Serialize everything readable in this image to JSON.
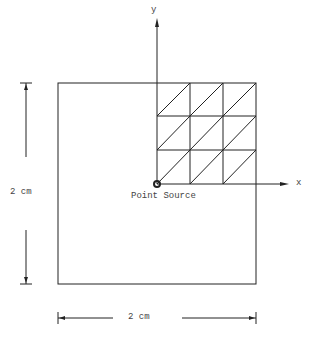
{
  "diagram": {
    "axis_x_label": "x",
    "axis_y_label": "y",
    "source_label": "Point Source",
    "height_dimension": "2 cm",
    "width_dimension": "2 cm",
    "grid": {
      "rows": 3,
      "cols": 3,
      "diagonals": "each cell split by diagonal from lower-left to upper-right"
    },
    "colors": {
      "line": "#222222",
      "text": "#444444"
    }
  }
}
